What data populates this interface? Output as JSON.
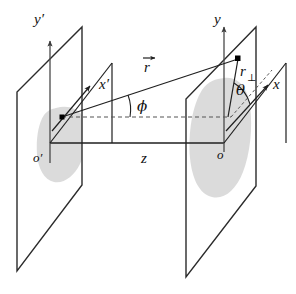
{
  "figure": {
    "title": "",
    "type": "3d-geometry-diagram",
    "background_color": "#ffffff",
    "line_color": "#2b2b2b",
    "blob_color": "#d8d8d8"
  },
  "labels": {
    "y_prime": "y′",
    "x_prime": "x′",
    "o_prime": "o′",
    "y": "y",
    "x": "x",
    "o": "o",
    "z": "z",
    "r_vector": "r",
    "r_perp_base": "r",
    "r_perp_sub": "⊥",
    "phi": "ϕ",
    "theta": "θ"
  },
  "elements": {
    "left_plane": "left-plane",
    "right_plane": "right-plane",
    "left_blob": "left-blob",
    "right_blob": "right-blob",
    "left_origin_dot": "left-origin-point",
    "target_point_dot": "target-point",
    "z_axis": "z-axis-segment",
    "r_vector_line": "r-vector",
    "r_perp_line": "r-perpendicular-segment",
    "phi_arc": "phi-angle-arc",
    "theta_arc": "theta-angle-arc",
    "dashed_baseline": "horizontal-dashed-reference-line",
    "x_axis_dashed_extension": "x-axis-dashed-extension"
  }
}
